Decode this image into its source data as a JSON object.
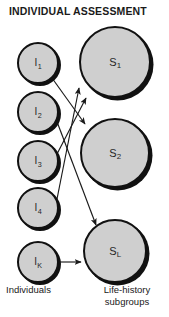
{
  "title": "INDIVIDUAL ASSESSMENT",
  "colors": {
    "node_fill": "#cfcfcf",
    "node_outline": "#111111",
    "edge": "#1a1a1a",
    "background": "#ffffff",
    "text": "#1a1a1a"
  },
  "columns": {
    "left": {
      "caption": "Individuals",
      "nodes": [
        {
          "id": "I1",
          "base": "I",
          "sub": "1",
          "cx": 38,
          "cy": 63,
          "r": 21
        },
        {
          "id": "I2",
          "base": "I",
          "sub": "2",
          "cx": 38,
          "cy": 112,
          "r": 21
        },
        {
          "id": "I3",
          "base": "I",
          "sub": "3",
          "cx": 38,
          "cy": 161,
          "r": 21
        },
        {
          "id": "I4",
          "base": "I",
          "sub": "4",
          "cx": 38,
          "cy": 208,
          "r": 21
        },
        {
          "id": "IK",
          "base": "I",
          "sub": "K",
          "cx": 38,
          "cy": 262,
          "r": 21
        }
      ]
    },
    "right": {
      "caption_line1": "Life-history",
      "caption_line2": "subgroups",
      "nodes": [
        {
          "id": "S1",
          "base": "S",
          "sub": "1",
          "cx": 115,
          "cy": 62,
          "r": 36
        },
        {
          "id": "S2",
          "base": "S",
          "sub": "2",
          "cx": 115,
          "cy": 153,
          "r": 35
        },
        {
          "id": "SL",
          "base": "S",
          "sub": "L",
          "cx": 115,
          "cy": 251,
          "r": 32
        }
      ]
    }
  },
  "edges": [
    {
      "from": "I1",
      "to": "S2",
      "x1": 52,
      "y1": 78,
      "x2": 85,
      "y2": 124,
      "arrow": true
    },
    {
      "from": "I2",
      "to": "SL",
      "x1": 56,
      "y1": 119,
      "x2": 96,
      "y2": 225,
      "arrow": true
    },
    {
      "from": "I3",
      "to": "S1",
      "x1": 57,
      "y1": 154,
      "x2": 86,
      "y2": 98,
      "arrow": true
    },
    {
      "from": "I4",
      "to": "S1",
      "x1": 57,
      "y1": 199,
      "x2": 79,
      "y2": 88,
      "arrow": true
    },
    {
      "from": "IK",
      "to": "SL",
      "x1": 60,
      "y1": 262,
      "x2": 81,
      "y2": 262,
      "arrow": true
    }
  ]
}
